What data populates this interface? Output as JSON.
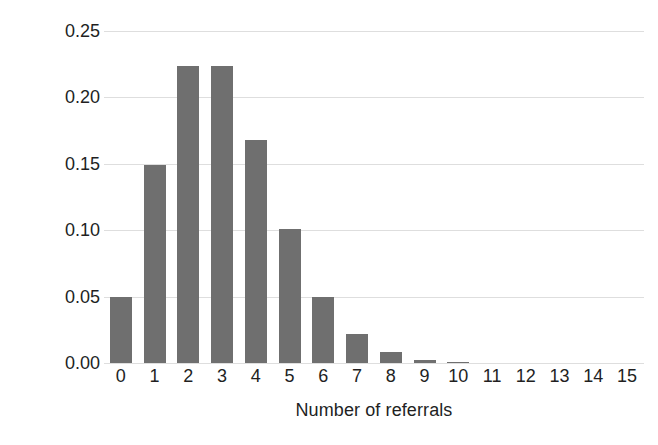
{
  "chart_data": {
    "type": "bar",
    "title": "",
    "subtitle": "",
    "xlabel": "Number of referrals",
    "ylabel": "Probability",
    "categories": [
      "0",
      "1",
      "2",
      "3",
      "4",
      "5",
      "6",
      "7",
      "8",
      "9",
      "10",
      "11",
      "12",
      "13",
      "14",
      "15"
    ],
    "values": [
      0.05,
      0.149,
      0.224,
      0.224,
      0.168,
      0.101,
      0.05,
      0.022,
      0.008,
      0.002,
      0.0005,
      0.0,
      0.0,
      0.0,
      0.0,
      0.0
    ],
    "series": [
      {
        "name": "Probability",
        "values": [
          0.05,
          0.149,
          0.224,
          0.224,
          0.168,
          0.101,
          0.05,
          0.022,
          0.008,
          0.002,
          0.0005,
          0.0,
          0.0,
          0.0,
          0.0,
          0.0
        ]
      }
    ],
    "ylim": [
      0.0,
      0.25
    ],
    "xlim": [
      -0.5,
      15.5
    ],
    "ytick_labels": [
      "0.00",
      "0.05",
      "0.10",
      "0.15",
      "0.20",
      "0.25"
    ],
    "ytick_values": [
      0.0,
      0.05,
      0.1,
      0.15,
      0.2,
      0.25
    ],
    "xtick_labels": [
      "0",
      "1",
      "2",
      "3",
      "4",
      "5",
      "6",
      "7",
      "8",
      "9",
      "10",
      "11",
      "12",
      "13",
      "14",
      "15"
    ],
    "grid": "horizontal",
    "legend": "none",
    "legend_position": "",
    "annotations": [],
    "colors": {
      "bar": "#6f6f6f",
      "gridline": "#dedede",
      "text": "#221f1f",
      "background": "#ffffff"
    }
  }
}
